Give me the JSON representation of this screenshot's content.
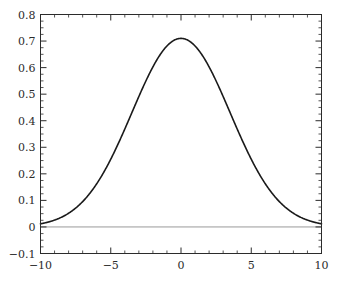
{
  "chart_data": {
    "type": "line",
    "title": "",
    "subtitle": "",
    "xlabel": "",
    "ylabel": "",
    "xlim": [
      -10,
      10
    ],
    "ylim": [
      -0.1,
      0.8
    ],
    "grid": false,
    "legend": null,
    "legend_position": "none",
    "frame": "box",
    "tick_direction": "in",
    "xticks_major": [
      -10,
      -5,
      0,
      5,
      10
    ],
    "xtick_labels": [
      "-10",
      "-5",
      "0",
      "5",
      "10"
    ],
    "xticks_minor_step": 1,
    "yticks_major": [
      -0.1,
      0,
      0.1,
      0.2,
      0.3,
      0.4,
      0.5,
      0.6,
      0.7,
      0.8
    ],
    "ytick_labels": [
      "-0.1",
      "0",
      "0.1",
      "0.2",
      "0.3",
      "0.4",
      "0.5",
      "0.6",
      "0.7",
      "0.8"
    ],
    "yticks_minor_step": 0.025,
    "series": [
      {
        "name": "gaussian-curve",
        "color": "#1a1a1a",
        "line_width": 1.6,
        "peak_x": 0,
        "peak_y": 0.71,
        "x": [
          -10,
          -9.5,
          -9,
          -8.5,
          -8,
          -7.5,
          -7,
          -6.5,
          -6,
          -5.5,
          -5,
          -4.5,
          -4,
          -3.5,
          -3,
          -2.5,
          -2,
          -1.5,
          -1,
          -0.5,
          0,
          0.5,
          1,
          1.5,
          2,
          2.5,
          3,
          3.5,
          4,
          4.5,
          5,
          5.5,
          6,
          6.5,
          7,
          7.5,
          8,
          8.5,
          9,
          9.5,
          10
        ],
        "y": [
          0.008,
          0.012,
          0.019,
          0.029,
          0.043,
          0.062,
          0.087,
          0.119,
          0.158,
          0.204,
          0.255,
          0.311,
          0.368,
          0.425,
          0.478,
          0.527,
          0.57,
          0.61,
          0.648,
          0.683,
          0.71,
          0.683,
          0.648,
          0.61,
          0.57,
          0.527,
          0.478,
          0.425,
          0.368,
          0.311,
          0.255,
          0.204,
          0.158,
          0.119,
          0.087,
          0.062,
          0.043,
          0.029,
          0.019,
          0.012,
          0.008
        ]
      },
      {
        "name": "zero-baseline",
        "color": "#9a9a9a",
        "line_width": 1.0,
        "constant_y": 0
      }
    ]
  },
  "axes": {
    "frame_color": "#2b2b2b",
    "tick_color": "#2b2b2b",
    "label_color": "#2b2b2b"
  }
}
